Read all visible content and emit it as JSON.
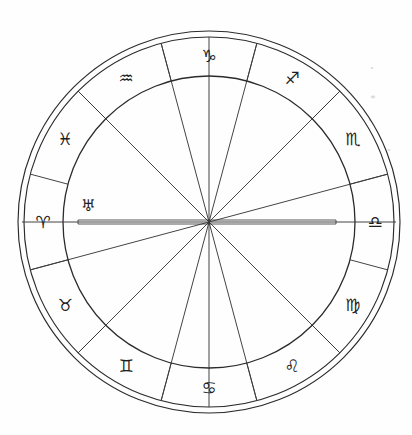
{
  "chart_data": {
    "type": "pie",
    "subtitle": "Twelve-sign zodiac wheel with house cusp spokes",
    "xlabel": "",
    "ylabel": "",
    "grid": false,
    "legend_position": "none",
    "geometry": {
      "center_x": 209,
      "center_y": 222,
      "outer_radius_outer": 191,
      "outer_radius_inner": 185,
      "inner_radius": 146,
      "sector_count": 12,
      "degrees_per_sector": 30,
      "rotation_offset_deg": 15
    },
    "categories": [
      "Aries",
      "Taurus",
      "Gemini",
      "Cancer",
      "Leo",
      "Virgo",
      "Libra",
      "Scorpio",
      "Sagittarius",
      "Capricorn",
      "Aquarius",
      "Pisces"
    ],
    "values": [
      30,
      30,
      30,
      30,
      30,
      30,
      30,
      30,
      30,
      30,
      30,
      30
    ],
    "signs": [
      {
        "name": "Aries",
        "glyph": "♈",
        "angle_deg": 180,
        "label_radius": 166,
        "glyph_size": 16
      },
      {
        "name": "Taurus",
        "glyph": "♉",
        "angle_deg": 210,
        "label_radius": 166,
        "glyph_size": 17
      },
      {
        "name": "Gemini",
        "glyph": "♊",
        "angle_deg": 240,
        "label_radius": 166,
        "glyph_size": 17
      },
      {
        "name": "Cancer",
        "glyph": "♋",
        "angle_deg": 270,
        "label_radius": 166,
        "glyph_size": 17
      },
      {
        "name": "Leo",
        "glyph": "♌",
        "angle_deg": 300,
        "label_radius": 166,
        "glyph_size": 17
      },
      {
        "name": "Virgo",
        "glyph": "♍",
        "angle_deg": 330,
        "label_radius": 166,
        "glyph_size": 17
      },
      {
        "name": "Libra",
        "glyph": "♎",
        "angle_deg": 0,
        "label_radius": 166,
        "glyph_size": 17
      },
      {
        "name": "Scorpio",
        "glyph": "♏",
        "angle_deg": 30,
        "label_radius": 166,
        "glyph_size": 17
      },
      {
        "name": "Sagittarius",
        "glyph": "♐",
        "angle_deg": 60,
        "label_radius": 166,
        "glyph_size": 17
      },
      {
        "name": "Capricorn",
        "glyph": "♑",
        "angle_deg": 90,
        "label_radius": 166,
        "glyph_size": 17
      },
      {
        "name": "Aquarius",
        "glyph": "♒",
        "angle_deg": 120,
        "label_radius": 166,
        "glyph_size": 17
      },
      {
        "name": "Pisces",
        "glyph": "♓",
        "angle_deg": 150,
        "label_radius": 166,
        "glyph_size": 16
      }
    ],
    "planets": [
      {
        "name": "Uranus",
        "glyph": "♅",
        "angle_deg": 172,
        "radius": 122,
        "glyph_size": 16
      }
    ],
    "house_cusps": [
      {
        "house": 1,
        "angle_deg": 180
      },
      {
        "house": 2,
        "angle_deg": 195
      },
      {
        "house": 3,
        "angle_deg": 225
      },
      {
        "house": 4,
        "angle_deg": 255
      },
      {
        "house": 5,
        "angle_deg": 285
      },
      {
        "house": 6,
        "angle_deg": 315
      },
      {
        "house": 7,
        "angle_deg": 0
      },
      {
        "house": 8,
        "angle_deg": 15
      },
      {
        "house": 9,
        "angle_deg": 45
      },
      {
        "house": 10,
        "angle_deg": 75
      },
      {
        "house": 11,
        "angle_deg": 105
      },
      {
        "house": 12,
        "angle_deg": 135
      }
    ],
    "sector_boundaries_deg": [
      15,
      45,
      75,
      105,
      135,
      165,
      195,
      225,
      255,
      285,
      315,
      345
    ],
    "axes": [
      {
        "name": "Ascendant-Descendant",
        "angle_deg": 0,
        "style": "double-line",
        "left_end_x": 22,
        "right_end_x": 396,
        "bar_left_x": 78,
        "bar_right_x": 336,
        "bar_half_thickness": 2
      }
    ],
    "colors": {
      "background": "#fefefe",
      "stroke": "#2b2b2b",
      "spoke_stroke": "#3a3a3a",
      "glyph_fill": "#1e1e1e"
    }
  }
}
